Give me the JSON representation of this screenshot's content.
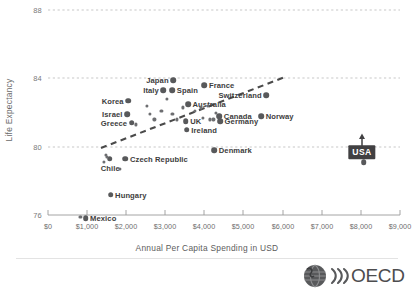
{
  "chart_data": {
    "type": "scatter",
    "title": "",
    "xlabel": "Annual Per Capita Spending in USD",
    "ylabel": "Life Expectancy",
    "xlim": [
      0,
      9000
    ],
    "ylim": [
      76,
      88
    ],
    "grid": "horizontal-dashed",
    "legend": "none",
    "yticks": [
      "88",
      "84",
      "80",
      "76"
    ],
    "ytick_values": [
      88,
      84,
      80,
      76
    ],
    "xticks": [
      "$0",
      "$1,000",
      "$2,000",
      "$3,000",
      "$4,000",
      "$5,000",
      "$6,000",
      "$7,000",
      "$8,000",
      "$9,000"
    ],
    "xtick_values": [
      0,
      1000,
      2000,
      3000,
      4000,
      5000,
      6000,
      7000,
      8000,
      9000
    ],
    "points": [
      {
        "label": "Japan",
        "x": 3200,
        "y": 83.9,
        "labeled": true,
        "label_side": "left"
      },
      {
        "label": "Italy",
        "x": 2950,
        "y": 83.3,
        "labeled": true,
        "label_side": "left"
      },
      {
        "label": "Spain",
        "x": 3180,
        "y": 83.3,
        "labeled": true,
        "label_side": "right"
      },
      {
        "label": "France",
        "x": 4000,
        "y": 83.6,
        "labeled": true,
        "label_side": "right"
      },
      {
        "label": "Switzerland",
        "x": 5580,
        "y": 83.0,
        "labeled": true,
        "label_side": "left"
      },
      {
        "label": "Korea",
        "x": 2050,
        "y": 82.7,
        "labeled": true,
        "label_side": "left"
      },
      {
        "label": "Australia",
        "x": 3580,
        "y": 82.5,
        "labeled": true,
        "label_side": "right"
      },
      {
        "label": "Israel",
        "x": 2020,
        "y": 81.9,
        "labeled": true,
        "label_side": "left"
      },
      {
        "label": "Canada",
        "x": 4380,
        "y": 81.8,
        "labeled": true,
        "label_side": "right"
      },
      {
        "label": "Norway",
        "x": 5450,
        "y": 81.8,
        "labeled": true,
        "label_side": "right"
      },
      {
        "label": "Greece",
        "x": 2140,
        "y": 81.4,
        "labeled": true,
        "label_side": "left"
      },
      {
        "label": "UK",
        "x": 3520,
        "y": 81.5,
        "labeled": true,
        "label_side": "right"
      },
      {
        "label": "Germany",
        "x": 4400,
        "y": 81.5,
        "labeled": true,
        "label_side": "right"
      },
      {
        "label": "Ireland",
        "x": 3550,
        "y": 81.0,
        "labeled": true,
        "label_side": "right"
      },
      {
        "label": "Denmark",
        "x": 4250,
        "y": 79.8,
        "labeled": true,
        "label_side": "right"
      },
      {
        "label": "Czech Republic",
        "x": 1980,
        "y": 79.3,
        "labeled": true,
        "label_side": "right"
      },
      {
        "label": "Chile",
        "x": 1580,
        "y": 79.3,
        "labeled": true,
        "label_side": "below"
      },
      {
        "label": "Hungary",
        "x": 1600,
        "y": 77.2,
        "labeled": true,
        "label_side": "right"
      },
      {
        "label": "Mexico",
        "x": 960,
        "y": 75.8,
        "labeled": true,
        "label_side": "right"
      },
      {
        "label": "USA",
        "x": 8070,
        "y": 79.1,
        "labeled": true,
        "label_side": "callout"
      },
      {
        "label": "",
        "x": 1430,
        "y": 79.1,
        "labeled": false
      },
      {
        "label": "",
        "x": 1480,
        "y": 79.5,
        "labeled": false
      },
      {
        "label": "",
        "x": 1500,
        "y": 79.4,
        "labeled": false
      },
      {
        "label": "",
        "x": 1830,
        "y": 78.7,
        "labeled": false
      },
      {
        "label": "",
        "x": 830,
        "y": 75.9,
        "labeled": false
      },
      {
        "label": "",
        "x": 2530,
        "y": 82.4,
        "labeled": false
      },
      {
        "label": "",
        "x": 2900,
        "y": 82.1,
        "labeled": false
      },
      {
        "label": "",
        "x": 2720,
        "y": 81.6,
        "labeled": false
      },
      {
        "label": "",
        "x": 3030,
        "y": 82.8,
        "labeled": false
      },
      {
        "label": "",
        "x": 3180,
        "y": 81.9,
        "labeled": false
      },
      {
        "label": "",
        "x": 3300,
        "y": 81.6,
        "labeled": false
      },
      {
        "label": "",
        "x": 3450,
        "y": 82.3,
        "labeled": false
      },
      {
        "label": "",
        "x": 3760,
        "y": 82.1,
        "labeled": false
      },
      {
        "label": "",
        "x": 3900,
        "y": 82.3,
        "labeled": false
      },
      {
        "label": "",
        "x": 3960,
        "y": 81.7,
        "labeled": false
      },
      {
        "label": "",
        "x": 4080,
        "y": 82.4,
        "labeled": false
      },
      {
        "label": "",
        "x": 4150,
        "y": 81.6,
        "labeled": false
      },
      {
        "label": "",
        "x": 4230,
        "y": 81.6,
        "labeled": false
      },
      {
        "label": "",
        "x": 4300,
        "y": 82.0,
        "labeled": false
      },
      {
        "label": "",
        "x": 2240,
        "y": 81.3,
        "labeled": false
      },
      {
        "label": "",
        "x": 2600,
        "y": 81.9,
        "labeled": false
      }
    ],
    "trendline": {
      "x0": 1370,
      "y0": 79.1,
      "x1": 6030,
      "y1": 83.2,
      "style": "dashed"
    },
    "annotations": [
      {
        "name": "usa-callout",
        "text": "USA",
        "points_to": "USA",
        "style": "dark-box-with-arrow"
      }
    ]
  },
  "branding": {
    "wordmark": "OECD",
    "globe_icon": "globe-icon",
    "waves_icon": "waves-icon"
  }
}
